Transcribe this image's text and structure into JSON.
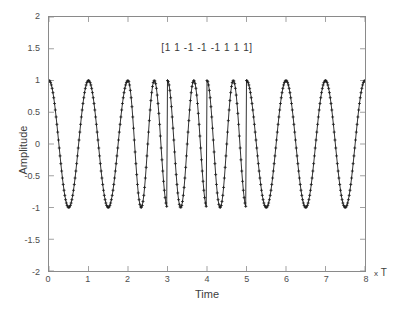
{
  "chart_data": {
    "type": "line",
    "title": "",
    "subtitle": "",
    "annotation": "[1  1  -1  -1  -1  1  1  1]",
    "xlabel": "Time",
    "ylabel": "Amplitude",
    "x_unit_label": "x T",
    "x_unit_prefix": "x",
    "x_unit_symbol": "T",
    "xlim": [
      0,
      8
    ],
    "ylim": [
      -2,
      2
    ],
    "xticks": [
      0,
      1,
      2,
      3,
      4,
      5,
      6,
      7,
      8
    ],
    "xtick_labels": [
      "0",
      "1",
      "2",
      "3",
      "4",
      "5",
      "6",
      "7",
      "8"
    ],
    "yticks": [
      -2,
      -1.5,
      -1,
      -0.5,
      0,
      0.5,
      1,
      1.5,
      2
    ],
    "ytick_labels": [
      "-2",
      "-1.5",
      "-1",
      "-0.5",
      "0",
      "0.5",
      "1",
      "1.5",
      "2"
    ],
    "grid": false,
    "legend": null,
    "legend_position": "none",
    "marker": "+",
    "line_color": "#1a1a1a",
    "marker_color": "#1a1a1a",
    "background_color": "#ffffff",
    "axis_color": "#8a8a8a",
    "modulation": "BFSK",
    "symbols": [
      1,
      1,
      -1,
      -1,
      -1,
      1,
      1,
      1
    ],
    "symbol_duration": 1,
    "amplitude": 1,
    "cycles_per_symbol_high_bit": 1,
    "cycles_per_symbol_low_bit": 1.5,
    "samples_per_symbol": 50,
    "series": [
      {
        "name": "FSK modulated signal",
        "description": "Amplitude 1 cosine; symbol value 1 uses 1 cycle per symbol period, symbol value -1 uses 1.5 cycles per symbol period.",
        "x_start": 0,
        "x_end": 8,
        "y_min": -1,
        "y_max": 1
      }
    ],
    "peaks_x": [
      0,
      1,
      2,
      2.6667,
      3.3333,
      4,
      4.6667,
      5.3333,
      6,
      7,
      8
    ],
    "troughs_x": [
      0.5,
      1.5,
      2.3333,
      3,
      3.6667,
      4.3333,
      5,
      5.5,
      6.5,
      7.5
    ]
  }
}
